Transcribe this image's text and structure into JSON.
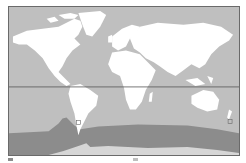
{
  "map": {
    "type": "world-map",
    "colors": {
      "ocean": "#bfbfbf",
      "land": "#ffffff",
      "band": "#8c8c8c",
      "frame": "#6a6a6a",
      "equator_line": "#555555"
    },
    "features": {
      "equator_line": "Equator",
      "southern_band": "Southern Ocean band",
      "markers": [
        {
          "name": "marker-south-america",
          "x": 78,
          "y": 123
        },
        {
          "name": "marker-new-zealand",
          "x": 230,
          "y": 122
        }
      ]
    }
  },
  "legend": {
    "items": [
      {
        "label": "",
        "color": "#8c8c8c"
      },
      {
        "label": "",
        "color": "#bfbfbf"
      }
    ]
  }
}
